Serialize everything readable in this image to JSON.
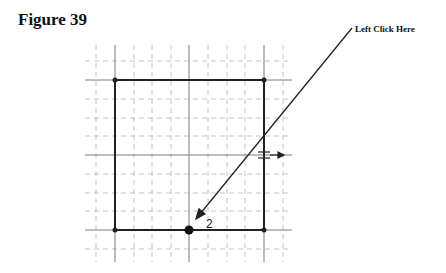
{
  "figure": {
    "title": "Figure 39"
  },
  "callout": {
    "text": "Left Click Here"
  },
  "drawing": {
    "point_label": "2",
    "grid": {
      "major_x": [
        115,
        189,
        264
      ],
      "major_y": [
        80,
        155,
        230
      ],
      "minor_spacing": 18.7
    },
    "rectangle": {
      "left": 115,
      "top": 80,
      "right": 264,
      "bottom": 230
    },
    "colors": {
      "grid": "#aaaaaa",
      "line": "#222222"
    }
  }
}
